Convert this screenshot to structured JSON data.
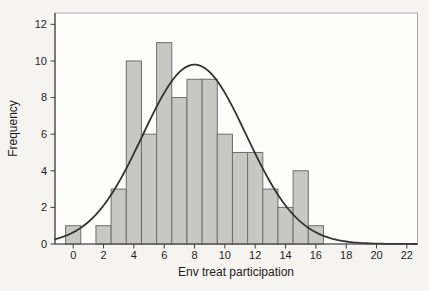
{
  "chart_data": {
    "type": "bar",
    "subtype": "histogram-with-normal-curve",
    "title": "",
    "xlabel": "Env treat participation",
    "ylabel": "Frequency",
    "bin_width": 1,
    "bin_centers": [
      0,
      2,
      3,
      4,
      5,
      6,
      7,
      8,
      9,
      10,
      11,
      12,
      13,
      14,
      15,
      16
    ],
    "frequencies": [
      1,
      1,
      3,
      10,
      6,
      11,
      8,
      9,
      9,
      6,
      5,
      5,
      3,
      2,
      4,
      1
    ],
    "x_ticks": [
      0,
      2,
      4,
      6,
      8,
      10,
      12,
      14,
      16,
      18,
      20,
      22
    ],
    "y_ticks": [
      0,
      2,
      4,
      6,
      8,
      10,
      12
    ],
    "xlim": [
      -1.2,
      22.7
    ],
    "ylim": [
      0,
      12.62
    ],
    "grid": "off",
    "legend": "none",
    "normal_curve": {
      "mean": 8.0,
      "sd": 3.42,
      "n": 84,
      "peak_height": 9.8
    },
    "colors": {
      "bar_fill": "#c7c8c4",
      "bar_border": "#6e6e6c",
      "curve": "#333333",
      "axis": "#3f3f3f",
      "box_border": "#a9a9a9",
      "tick_text": "#1d1d1d",
      "title_text": "#1d1d1d",
      "plot_bg": "#fdfdfc",
      "figure_bg": "#f6f4f0"
    }
  }
}
